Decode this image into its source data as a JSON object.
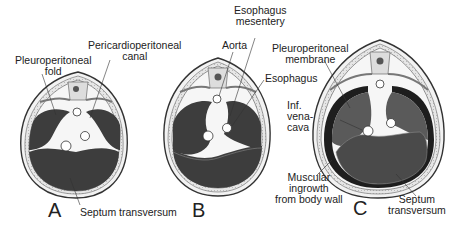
{
  "figure": {
    "panels": [
      {
        "id": "A",
        "letter": "A"
      },
      {
        "id": "B",
        "letter": "B"
      },
      {
        "id": "C",
        "letter": "C"
      }
    ],
    "labels": {
      "pleuroperitoneal_fold": [
        "Pleuroperitoneal",
        "fold"
      ],
      "pericardioperitoneal_canal": [
        "Pericardioperitoneal",
        "canal"
      ],
      "septum_transversum_a": "Septum  transversum",
      "aorta": "Aorta",
      "esophagus_mesentery": [
        "Esophagus",
        "mesentery"
      ],
      "esophagus": "Esophagus",
      "pleuroperitoneal_membrane": [
        "Pleuroperitoneal",
        "membrane"
      ],
      "inf_vena_cava": [
        "Inf.",
        "vena-",
        "cava"
      ],
      "muscular_ingrowth": [
        "Muscular",
        "ingrowth",
        "from body wall"
      ],
      "septum_transversum_c": [
        "Septum",
        "transversum"
      ]
    },
    "colors": {
      "dark_fill": "#3d3d3d",
      "mid_fill": "#5a5a5a",
      "body_wall": "#d8d8d8",
      "light_region": "#f4f4f4",
      "outline": "#333333",
      "muscle_band": "#1e1e1e"
    }
  }
}
